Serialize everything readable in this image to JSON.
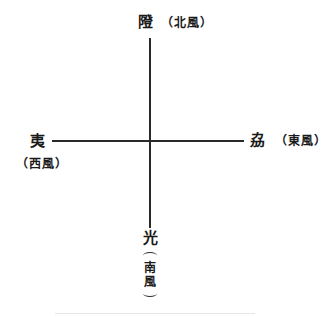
{
  "diagram": {
    "type": "compass-cross",
    "north": {
      "char": "隥",
      "gloss": "（北風）"
    },
    "west": {
      "char": "夷",
      "gloss": "（西風）"
    },
    "east": {
      "char": "劦",
      "gloss": "（東風）"
    },
    "south": {
      "char": "光",
      "gloss_chars": [
        "南",
        "風"
      ]
    }
  }
}
